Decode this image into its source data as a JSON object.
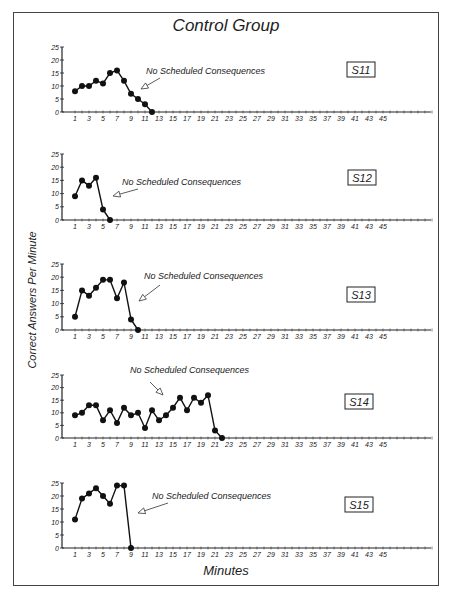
{
  "figure": {
    "title": "Control Group",
    "ylabel": "Correct Answers Per Minute",
    "xlabel": "Minutes"
  },
  "chart_data": [
    {
      "type": "line",
      "subject": "S11",
      "annotation": "No Scheduled Consequences",
      "xlabel": "Minutes",
      "ylabel": "Correct Answers Per Minute",
      "ylim": [
        0,
        25
      ],
      "yticks": [
        0,
        5,
        10,
        15,
        20,
        25
      ],
      "xticks": [
        1,
        3,
        5,
        7,
        9,
        11,
        13,
        15,
        17,
        19,
        21,
        23,
        25,
        27,
        29,
        31,
        33,
        35,
        37,
        39,
        41,
        43,
        45
      ],
      "x": [
        1,
        2,
        3,
        4,
        5,
        6,
        7,
        8,
        9,
        10,
        11,
        12
      ],
      "values": [
        8,
        10,
        10,
        12,
        11,
        15,
        16,
        12,
        7,
        5,
        3,
        0
      ]
    },
    {
      "type": "line",
      "subject": "S12",
      "annotation": "No Scheduled Consequences",
      "xlabel": "Minutes",
      "ylabel": "Correct Answers Per Minute",
      "ylim": [
        0,
        25
      ],
      "yticks": [
        0,
        5,
        10,
        15,
        20,
        25
      ],
      "xticks": [
        1,
        3,
        5,
        7,
        9,
        11,
        13,
        15,
        17,
        19,
        21,
        23,
        25,
        27,
        29,
        31,
        33,
        35,
        37,
        39,
        41,
        43,
        45
      ],
      "x": [
        1,
        2,
        3,
        4,
        5,
        6
      ],
      "values": [
        9,
        15,
        13,
        16,
        4,
        0
      ]
    },
    {
      "type": "line",
      "subject": "S13",
      "annotation": "No Scheduled Consequences",
      "xlabel": "Minutes",
      "ylabel": "Correct Answers Per Minute",
      "ylim": [
        0,
        25
      ],
      "yticks": [
        0,
        5,
        10,
        15,
        20,
        25
      ],
      "xticks": [
        1,
        3,
        5,
        7,
        9,
        11,
        13,
        15,
        17,
        19,
        21,
        23,
        25,
        27,
        29,
        31,
        33,
        35,
        37,
        39,
        41,
        43,
        45
      ],
      "x": [
        1,
        2,
        3,
        4,
        5,
        6,
        7,
        8,
        9,
        10
      ],
      "values": [
        5,
        15,
        13,
        16,
        19,
        19,
        12,
        18,
        4,
        0
      ]
    },
    {
      "type": "line",
      "subject": "S14",
      "annotation": "No Scheduled Consequences",
      "xlabel": "Minutes",
      "ylabel": "Correct Answers Per Minute",
      "ylim": [
        0,
        25
      ],
      "yticks": [
        0,
        5,
        10,
        15,
        20,
        25
      ],
      "xticks": [
        1,
        3,
        5,
        7,
        9,
        11,
        13,
        15,
        17,
        19,
        21,
        23,
        25,
        27,
        29,
        31,
        33,
        35,
        37,
        39,
        41,
        43,
        45
      ],
      "x": [
        1,
        2,
        3,
        4,
        5,
        6,
        7,
        8,
        9,
        10,
        11,
        12,
        13,
        14,
        15,
        16,
        17,
        18,
        19,
        20,
        21,
        22
      ],
      "values": [
        9,
        10,
        13,
        13,
        7,
        11,
        6,
        12,
        9,
        10,
        4,
        11,
        7,
        9,
        12,
        16,
        11,
        16,
        14,
        17,
        3,
        0
      ]
    },
    {
      "type": "line",
      "subject": "S15",
      "annotation": "No Scheduled Consequences",
      "xlabel": "Minutes",
      "ylabel": "Correct Answers Per Minute",
      "ylim": [
        0,
        25
      ],
      "yticks": [
        0,
        5,
        10,
        15,
        20,
        25
      ],
      "xticks": [
        1,
        3,
        5,
        7,
        9,
        11,
        13,
        15,
        17,
        19,
        21,
        23,
        25,
        27,
        29,
        31,
        33,
        35,
        37,
        39,
        41,
        43,
        45
      ],
      "x": [
        1,
        2,
        3,
        4,
        5,
        6,
        7,
        8,
        9
      ],
      "values": [
        11,
        19,
        21,
        23,
        20,
        17,
        24,
        24,
        0
      ]
    }
  ],
  "layout": {
    "panels": [
      {
        "base": 112,
        "top": 47,
        "ann": {
          "tx": 146,
          "ty": 74,
          "ax1": 160,
          "ay1": 78,
          "ax2": 141,
          "ay2": 89
        },
        "box": {
          "x": 347,
          "y": 62
        }
      },
      {
        "base": 220,
        "top": 154,
        "ann": {
          "tx": 122,
          "ty": 185,
          "ax1": 138,
          "ay1": 189,
          "ax2": 113,
          "ay2": 196
        },
        "box": {
          "x": 348,
          "y": 170
        }
      },
      {
        "base": 330,
        "top": 264,
        "ann": {
          "tx": 144,
          "ty": 279,
          "ax1": 160,
          "ay1": 285,
          "ax2": 139,
          "ay2": 301
        },
        "box": {
          "x": 347,
          "y": 287
        }
      },
      {
        "base": 438,
        "top": 375,
        "ann": {
          "tx": 130,
          "ty": 373,
          "ax1": 150,
          "ay1": 382,
          "ax2": 163,
          "ay2": 395
        },
        "box": {
          "x": 345,
          "y": 394
        }
      },
      {
        "base": 548,
        "top": 483,
        "ann": {
          "tx": 152,
          "ty": 499,
          "ax1": 168,
          "ay1": 503,
          "ax2": 138,
          "ay2": 513
        },
        "box": {
          "x": 345,
          "y": 497
        }
      }
    ],
    "axis_x": 62,
    "axis_end": 431,
    "x0": 68,
    "px_per_min": 7,
    "max_minutes": 52
  }
}
